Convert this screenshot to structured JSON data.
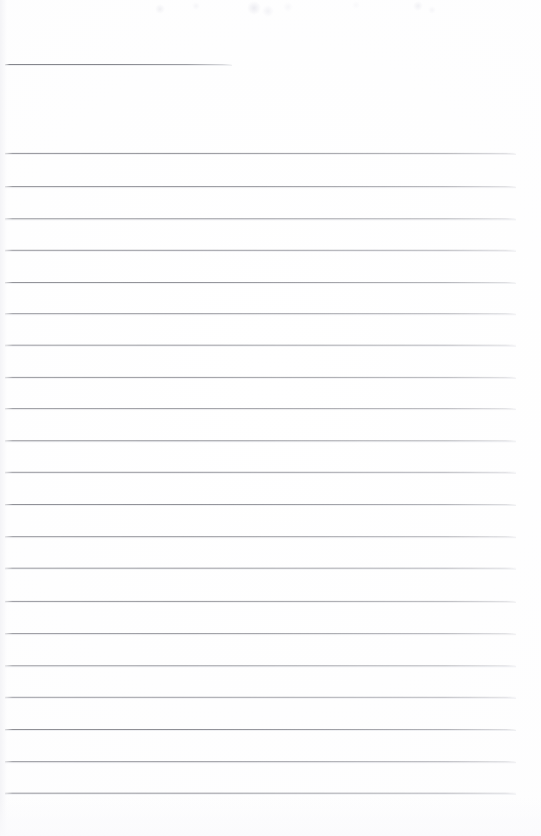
{
  "document": {
    "kind": "scanned-lined-notepad-page",
    "page_width": 541,
    "page_height": 836,
    "background_color": "#ffffff",
    "rule_color": "#84858c",
    "rule_thickness_px": 1,
    "body_text": "",
    "title_text": "",
    "note": "Blank ruled page — no handwriting or printed text present"
  },
  "title_rule": {
    "name": "title-rule",
    "x": 5,
    "y": 64,
    "width": 227,
    "height": 1,
    "color": "#84858c"
  },
  "body_rules": {
    "left": 5,
    "width": 511,
    "height": 1,
    "color": "#84858c",
    "spacing": 32,
    "count": 21,
    "lines": [
      {
        "index": 1,
        "y": 153
      },
      {
        "index": 2,
        "y": 186
      },
      {
        "index": 3,
        "y": 218
      },
      {
        "index": 4,
        "y": 250
      },
      {
        "index": 5,
        "y": 282
      },
      {
        "index": 6,
        "y": 313
      },
      {
        "index": 7,
        "y": 345
      },
      {
        "index": 8,
        "y": 377
      },
      {
        "index": 9,
        "y": 408
      },
      {
        "index": 10,
        "y": 440
      },
      {
        "index": 11,
        "y": 472
      },
      {
        "index": 12,
        "y": 504
      },
      {
        "index": 13,
        "y": 536
      },
      {
        "index": 14,
        "y": 568
      },
      {
        "index": 15,
        "y": 601
      },
      {
        "index": 16,
        "y": 633
      },
      {
        "index": 17,
        "y": 665
      },
      {
        "index": 18,
        "y": 697
      },
      {
        "index": 19,
        "y": 729
      },
      {
        "index": 20,
        "y": 761
      },
      {
        "index": 21,
        "y": 793
      }
    ]
  }
}
